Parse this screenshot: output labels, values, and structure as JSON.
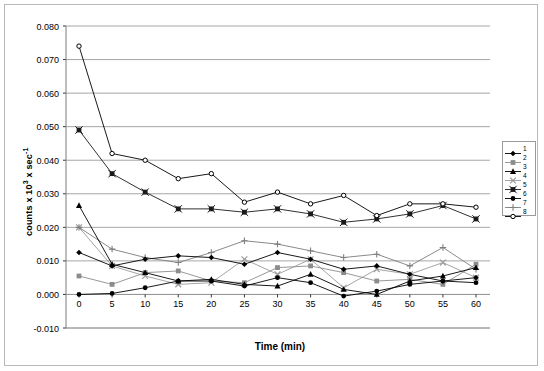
{
  "axis": {
    "y_title": "counts x 10³ x sec⁻¹",
    "y_title_base": "counts x 10",
    "y_title_sup1": "3",
    "y_title_mid": " x sec",
    "y_title_sup2": "-1",
    "x_title": "Time (min)"
  },
  "legend": {
    "items": [
      {
        "label": "1",
        "marker": "diamond-filled",
        "color": "#000000"
      },
      {
        "label": "2",
        "marker": "square-filled",
        "color": "#8c8c8c"
      },
      {
        "label": "3",
        "marker": "triangle-filled",
        "color": "#000000"
      },
      {
        "label": "4",
        "marker": "cross-x",
        "color": "#9b9b9b"
      },
      {
        "label": "5",
        "marker": "star-square",
        "color": "#1a1a1a"
      },
      {
        "label": "6",
        "marker": "circle-filled",
        "color": "#000000"
      },
      {
        "label": "7",
        "marker": "plus",
        "color": "#7d7d7d"
      },
      {
        "label": "8",
        "marker": "circle-open",
        "color": "#000000"
      }
    ]
  },
  "chart_data": {
    "type": "line",
    "title": "",
    "xlabel": "Time (min)",
    "ylabel": "counts x 10^3 x sec^-1",
    "x": [
      0,
      5,
      10,
      15,
      20,
      25,
      30,
      35,
      40,
      45,
      50,
      55,
      60
    ],
    "xlim": [
      0,
      60
    ],
    "ylim": [
      -0.01,
      0.08
    ],
    "ytick_labels": [
      "0.080",
      "0.070",
      "0.060",
      "0.050",
      "0.040",
      "0.030",
      "0.020",
      "0.010",
      "0.000",
      "-0.010"
    ],
    "yticks": [
      0.08,
      0.07,
      0.06,
      0.05,
      0.04,
      0.03,
      0.02,
      0.01,
      0.0,
      -0.01
    ],
    "xtick_labels": [
      "0",
      "5",
      "10",
      "15",
      "20",
      "25",
      "30",
      "35",
      "40",
      "45",
      "50",
      "55",
      "60"
    ],
    "grid": "horizontal",
    "legend_position": "right-outside",
    "series": [
      {
        "name": "1",
        "marker": "diamond-filled",
        "color": "#000000",
        "values": [
          0.0125,
          0.0085,
          0.0105,
          0.0115,
          0.011,
          0.009,
          0.0125,
          0.0105,
          0.0075,
          0.0085,
          0.006,
          0.004,
          0.005
        ]
      },
      {
        "name": "2",
        "marker": "square-filled",
        "color": "#8c8c8c",
        "values": [
          0.0055,
          0.003,
          0.0065,
          0.007,
          0.004,
          0.0035,
          0.008,
          0.0085,
          0.0065,
          0.004,
          0.0045,
          0.003,
          0.009
        ]
      },
      {
        "name": "3",
        "marker": "triangle-filled",
        "color": "#000000",
        "values": [
          0.0265,
          0.009,
          0.0065,
          0.004,
          0.0045,
          0.003,
          0.0025,
          0.006,
          0.0015,
          0.0,
          0.004,
          0.0055,
          0.008
        ]
      },
      {
        "name": "4",
        "marker": "cross-x",
        "color": "#9b9b9b",
        "values": [
          0.02,
          0.0085,
          0.0055,
          0.003,
          0.0035,
          0.0105,
          0.006,
          0.0105,
          0.002,
          0.0075,
          0.006,
          0.0095,
          0.005
        ]
      },
      {
        "name": "5",
        "marker": "star-square",
        "color": "#1a1a1a",
        "values": [
          0.049,
          0.036,
          0.0305,
          0.0255,
          0.0255,
          0.0245,
          0.0255,
          0.024,
          0.0215,
          0.0225,
          0.024,
          0.0265,
          0.0225
        ]
      },
      {
        "name": "6",
        "marker": "circle-filled",
        "color": "#000000",
        "values": [
          0.0,
          0.0003,
          0.002,
          0.004,
          0.004,
          0.0025,
          0.005,
          0.0035,
          -0.0005,
          0.001,
          0.003,
          0.004,
          0.0035
        ]
      },
      {
        "name": "7",
        "marker": "plus",
        "color": "#7d7d7d",
        "values": [
          0.02,
          0.0135,
          0.011,
          0.0095,
          0.0125,
          0.016,
          0.015,
          0.013,
          0.011,
          0.012,
          0.0085,
          0.014,
          0.0075
        ]
      },
      {
        "name": "8",
        "marker": "circle-open",
        "color": "#000000",
        "values": [
          0.074,
          0.042,
          0.04,
          0.0345,
          0.036,
          0.0275,
          0.0305,
          0.027,
          0.0295,
          0.0235,
          0.027,
          0.027,
          0.026
        ]
      }
    ]
  }
}
